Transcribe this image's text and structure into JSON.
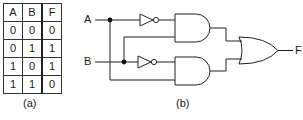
{
  "truth_table": {
    "headers": [
      "A",
      "B",
      "F"
    ],
    "rows": [
      [
        "0",
        "0",
        "0"
      ],
      [
        "0",
        "1",
        "1"
      ],
      [
        "1",
        "0",
        "1"
      ],
      [
        "1",
        "1",
        "0"
      ]
    ],
    "caption": "(a)"
  },
  "circuit": {
    "inputs": [
      "A",
      "B"
    ],
    "output": "F",
    "gates": [
      "NOT (A)",
      "NOT (B)",
      "AND (A', B)",
      "AND (B', A)",
      "OR"
    ],
    "caption": "(b)"
  }
}
